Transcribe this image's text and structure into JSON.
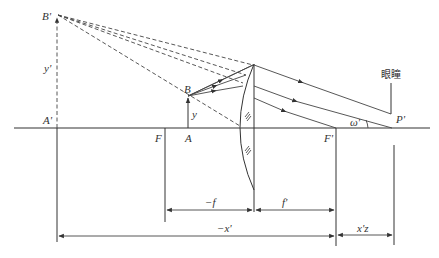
{
  "diagram": {
    "labels": {
      "B_prime": "B'",
      "A_prime": "A'",
      "y_prime": "y'",
      "B": "B",
      "A": "A",
      "y": "y",
      "F": "F",
      "F_prime": "F'",
      "P_prime": "P'",
      "omega_prime": "ω'",
      "eye": "眼瞳",
      "minus_f": "−f",
      "f_prime": "f'",
      "minus_x_prime": "−x'",
      "x_z_prime": "x'z"
    },
    "colors": {
      "line": "#333333",
      "background": "#ffffff"
    }
  }
}
